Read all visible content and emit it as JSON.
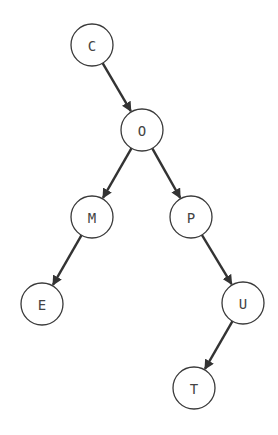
{
  "diagram": {
    "type": "tree",
    "colors": {
      "node_stroke": "#3a3a3a",
      "edge": "#333333",
      "label": "#444444",
      "background": "#ffffff"
    },
    "node_radius": 21,
    "nodes": [
      {
        "id": "C",
        "label": "C",
        "x": 92,
        "y": 45
      },
      {
        "id": "O",
        "label": "O",
        "x": 142,
        "y": 130
      },
      {
        "id": "M",
        "label": "M",
        "x": 92,
        "y": 217
      },
      {
        "id": "P",
        "label": "P",
        "x": 191,
        "y": 217
      },
      {
        "id": "E",
        "label": "E",
        "x": 42,
        "y": 304
      },
      {
        "id": "U",
        "label": "U",
        "x": 243,
        "y": 303
      },
      {
        "id": "T",
        "label": "T",
        "x": 194,
        "y": 388
      }
    ],
    "edges": [
      {
        "from": "C",
        "to": "O"
      },
      {
        "from": "O",
        "to": "M"
      },
      {
        "from": "O",
        "to": "P"
      },
      {
        "from": "M",
        "to": "E"
      },
      {
        "from": "P",
        "to": "U"
      },
      {
        "from": "U",
        "to": "T"
      }
    ]
  }
}
